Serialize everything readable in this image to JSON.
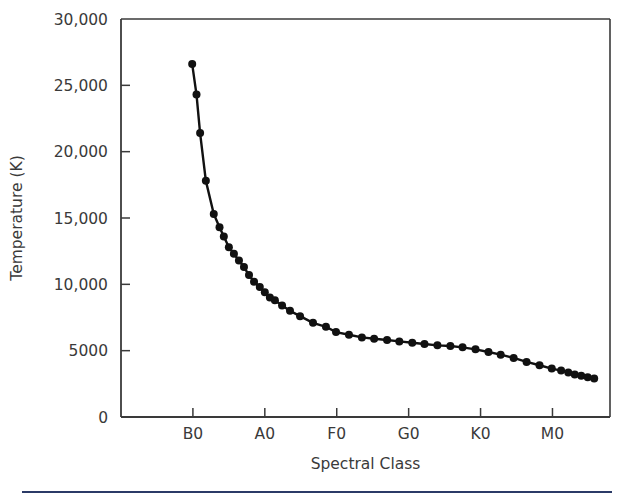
{
  "figure": {
    "background_color": "#ffffff",
    "axis_color": "#3a3a3a",
    "data_color": "#111111",
    "footer_rule_color": "#2b3a67"
  },
  "chart_data": {
    "type": "line",
    "title": "",
    "xlabel": "Spectral Class",
    "ylabel": "Temperature (K)",
    "grid": false,
    "legend": null,
    "ylim": [
      0,
      30000
    ],
    "ytick_values": [
      0,
      5000,
      10000,
      15000,
      20000,
      25000,
      30000
    ],
    "ytick_labels": [
      "0",
      "5000",
      "10,000",
      "15,000",
      "20,000",
      "25,000",
      "30,000"
    ],
    "xtick_labels": [
      "B0",
      "A0",
      "F0",
      "G0",
      "K0",
      "M0"
    ],
    "xtick_positions": [
      1.0,
      2.0,
      3.0,
      4.0,
      5.0,
      6.0
    ],
    "xlim": [
      0.0,
      6.8
    ],
    "marker": "filled-circle",
    "x": [
      0.99,
      1.05,
      1.1,
      1.18,
      1.29,
      1.37,
      1.43,
      1.5,
      1.57,
      1.64,
      1.71,
      1.78,
      1.85,
      1.93,
      2.0,
      2.07,
      2.14,
      2.24,
      2.35,
      2.49,
      2.67,
      2.85,
      2.99,
      3.17,
      3.35,
      3.52,
      3.7,
      3.87,
      4.05,
      4.22,
      4.4,
      4.58,
      4.75,
      4.93,
      5.11,
      5.28,
      5.46,
      5.64,
      5.82,
      5.99,
      6.12,
      6.22,
      6.31,
      6.4,
      6.49,
      6.58
    ],
    "y": [
      26600,
      24300,
      21400,
      17800,
      15300,
      14300,
      13600,
      12800,
      12300,
      11800,
      11300,
      10700,
      10200,
      9800,
      9400,
      9000,
      8800,
      8400,
      8000,
      7600,
      7100,
      6800,
      6400,
      6200,
      6000,
      5900,
      5800,
      5700,
      5600,
      5500,
      5400,
      5350,
      5250,
      5100,
      4900,
      4700,
      4450,
      4150,
      3900,
      3650,
      3500,
      3350,
      3200,
      3100,
      3000,
      2900
    ]
  }
}
